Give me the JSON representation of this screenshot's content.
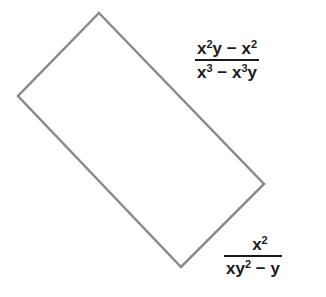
{
  "diagram": {
    "type": "rectangle-with-expressions",
    "rectangle": {
      "vertices": [
        [
          99,
          13
        ],
        [
          264,
          184
        ],
        [
          181,
          267
        ],
        [
          18,
          96
        ]
      ],
      "stroke": "#8a8a8a",
      "fill": "#ffffff"
    },
    "expressions": [
      {
        "name": "length",
        "numerator": "x²y − x²",
        "denominator": "x³ − x³y"
      },
      {
        "name": "width",
        "numerator": "x²",
        "denominator": "xy² − y"
      }
    ]
  }
}
